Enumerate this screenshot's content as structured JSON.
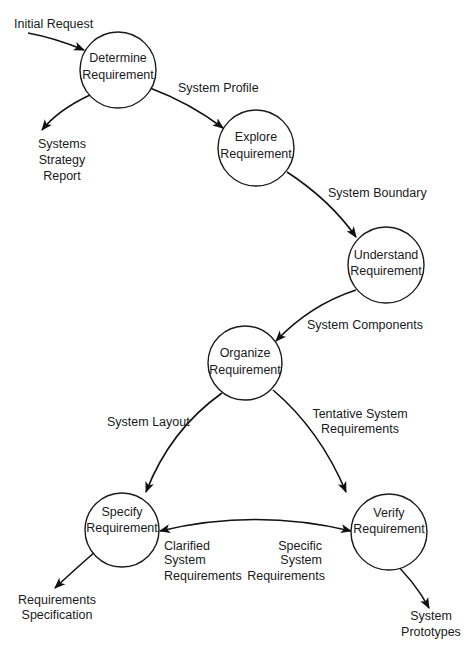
{
  "diagram": {
    "type": "data-flow",
    "nodes": [
      {
        "id": "determine",
        "line1": "Determine",
        "line2": "Requirement"
      },
      {
        "id": "explore",
        "line1": "Explore",
        "line2": "Requirement"
      },
      {
        "id": "understand",
        "line1": "Understand",
        "line2": "Requirement"
      },
      {
        "id": "organize",
        "line1": "Organize",
        "line2": "Requirement"
      },
      {
        "id": "specify",
        "line1": "Specify",
        "line2": "Requirement"
      },
      {
        "id": "verify",
        "line1": "Verify",
        "line2": "Requirement"
      }
    ],
    "flows": {
      "initial_request": {
        "line1": "Initial Request"
      },
      "systems_strategy_report": {
        "line1": "Systems",
        "line2": "Strategy",
        "line3": "Report"
      },
      "system_profile": {
        "line1": "System Profile"
      },
      "system_boundary": {
        "line1": "System Boundary"
      },
      "system_components": {
        "line1": "System Components"
      },
      "system_layout": {
        "line1": "System Layout"
      },
      "tentative_system_requirements": {
        "line1": "Tentative System",
        "line2": "Requirements"
      },
      "clarified_system_requirements": {
        "line1": "Clarified",
        "line2": "System",
        "line3": "Requirements"
      },
      "specific_system_requirements": {
        "line1": "Specific",
        "line2": "System",
        "line3": "Requirements"
      },
      "requirements_specification": {
        "line1": "Requirements",
        "line2": "Specification"
      },
      "system_prototypes": {
        "line1": "System",
        "line2": "Prototypes"
      }
    }
  }
}
